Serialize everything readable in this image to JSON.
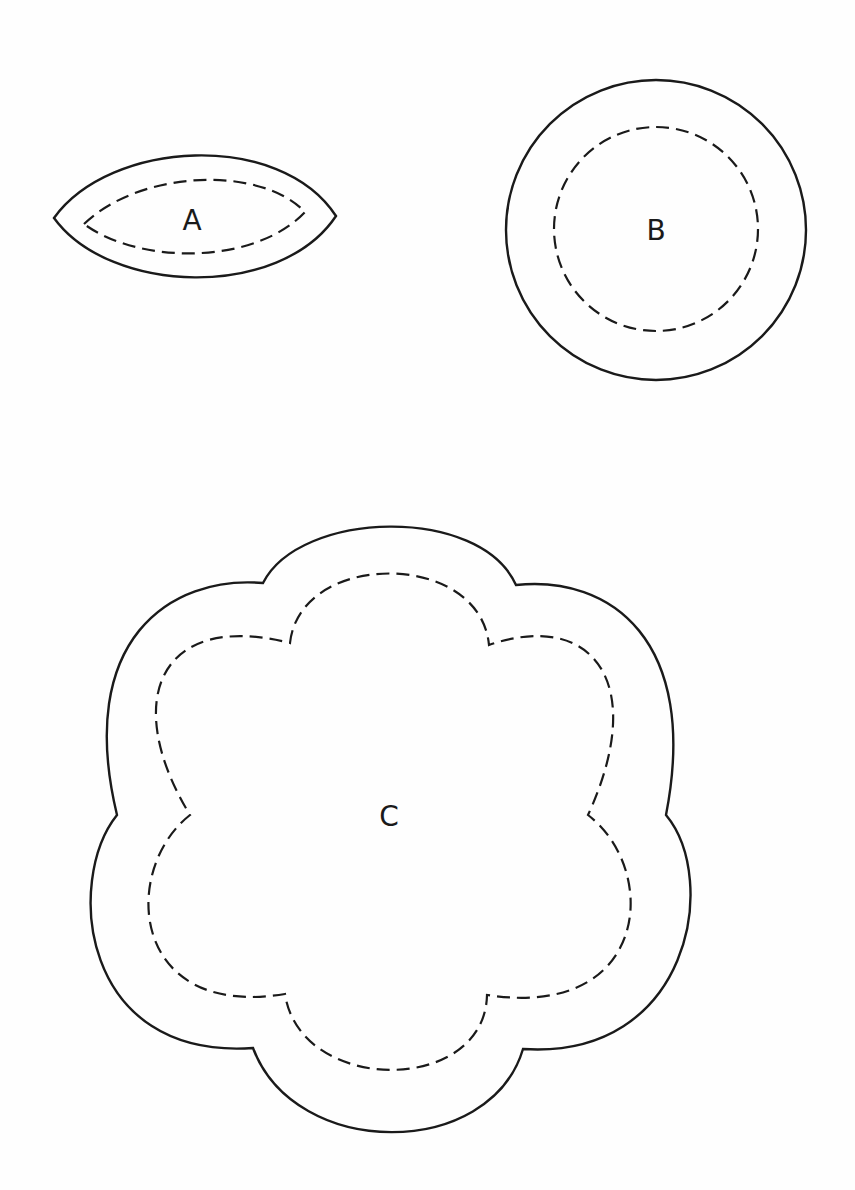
{
  "diagram": {
    "type": "sewing-pattern-pieces",
    "legend": {
      "solid_line": "cutting line",
      "dashed_line": "stitching line"
    },
    "pieces": [
      {
        "id": "A",
        "label": "A",
        "shape": "leaf / pointed oval"
      },
      {
        "id": "B",
        "label": "B",
        "shape": "circle"
      },
      {
        "id": "C",
        "label": "C",
        "shape": "six-lobed flower"
      }
    ],
    "colors": {
      "line": "#1a1a1a",
      "background": "#fefefe"
    }
  }
}
